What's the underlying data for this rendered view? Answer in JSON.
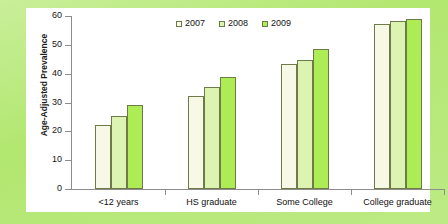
{
  "chart_data": {
    "type": "bar",
    "title": "",
    "subtitle": "",
    "xlabel": "",
    "ylabel": "Age-Adjusted Prevalence",
    "ylim": [
      0,
      60
    ],
    "yticks": [
      0,
      10,
      20,
      30,
      40,
      50,
      60
    ],
    "ytick_labels": [
      "0",
      "10",
      "20",
      "30",
      "40",
      "50",
      "60"
    ],
    "grid": false,
    "legend_position": "top-center",
    "categories": [
      "<12 years",
      "HS graduate",
      "Some College",
      "College graduate"
    ],
    "series": [
      {
        "name": "2007",
        "color": "#f7f9e6",
        "values": [
          22.3,
          32.3,
          43.5,
          57.4
        ]
      },
      {
        "name": "2008",
        "color": "#dcf3b2",
        "values": [
          25.2,
          35.4,
          44.8,
          58.1
        ]
      },
      {
        "name": "2009",
        "color": "#aeec55",
        "values": [
          29.3,
          38.7,
          48.6,
          59.1
        ]
      }
    ],
    "annotations": []
  },
  "legend": {
    "items": [
      {
        "label": "2007",
        "swatch": "legend-swatch-2007"
      },
      {
        "label": "2008",
        "swatch": "legend-swatch-2008"
      },
      {
        "label": "2009",
        "swatch": "legend-swatch-2009"
      }
    ]
  },
  "colors": {
    "figure_background": "#b2e770",
    "panel_background": "#ffffff",
    "axis": "#8d8d8d",
    "bar_outline": "#6d7a4a",
    "series_2007": "#f7f9e6",
    "series_2008": "#dcf3b2",
    "series_2009": "#aeec55",
    "text": "#101010"
  }
}
